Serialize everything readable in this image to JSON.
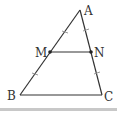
{
  "diagram": {
    "colors": {
      "line": "#333333",
      "tick": "#999999",
      "bar": "#c8c8c8"
    },
    "points": {
      "A": {
        "label": "A",
        "x": 80,
        "y": 10
      },
      "B": {
        "label": "B",
        "x": 20,
        "y": 95
      },
      "C": {
        "label": "C",
        "x": 102,
        "y": 95
      },
      "M": {
        "label": "M",
        "x": 50,
        "y": 52
      },
      "N": {
        "label": "N",
        "x": 91,
        "y": 52
      }
    },
    "segments": [
      "AB",
      "BC",
      "CA",
      "MN"
    ],
    "equal_marks": [
      "AM = MB",
      "AN = NC"
    ]
  }
}
